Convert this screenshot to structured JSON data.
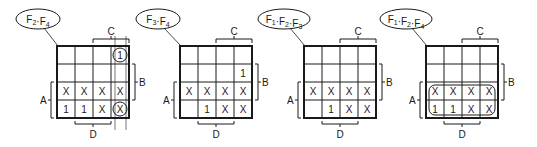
{
  "diagram": {
    "type": "karnaugh-map-set",
    "variables": {
      "row_top": "A",
      "row_right": "B",
      "col_top": "C",
      "col_bottom": "D"
    },
    "maps": [
      {
        "title": "F2·F4",
        "title_parts": [
          {
            "t": "F"
          },
          {
            "s": "2"
          },
          {
            "t": "·F"
          },
          {
            "s": "4"
          }
        ],
        "cells": [
          [
            "",
            "",
            "",
            "1"
          ],
          [
            "",
            "",
            "",
            ""
          ],
          [
            "X",
            "X",
            "X",
            "X"
          ],
          [
            "1",
            "1",
            "X",
            "X"
          ]
        ],
        "loops": [
          "cell-0-3",
          "cell-3-3"
        ]
      },
      {
        "title": "F3·F4",
        "title_parts": [
          {
            "t": "F"
          },
          {
            "s": "3"
          },
          {
            "t": "·F"
          },
          {
            "s": "4"
          }
        ],
        "cells": [
          [
            "",
            "",
            "",
            ""
          ],
          [
            "",
            "",
            "",
            "1"
          ],
          [
            "X",
            "X",
            "X",
            "X"
          ],
          [
            "",
            "1",
            "X",
            "X"
          ]
        ],
        "loops": []
      },
      {
        "title": "F1·F2·F3",
        "title_parts": [
          {
            "t": "F"
          },
          {
            "s": "1"
          },
          {
            "t": "·F"
          },
          {
            "s": "2"
          },
          {
            "t": "·F"
          },
          {
            "s": "3"
          }
        ],
        "cells": [
          [
            "",
            "",
            "",
            ""
          ],
          [
            "",
            "",
            "",
            ""
          ],
          [
            "X",
            "X",
            "X",
            "X"
          ],
          [
            "",
            "1",
            "X",
            "X"
          ]
        ],
        "loops": []
      },
      {
        "title": "F1·F2·F4",
        "title_parts": [
          {
            "t": "F"
          },
          {
            "s": "1"
          },
          {
            "t": "·F"
          },
          {
            "s": "2"
          },
          {
            "t": "·F"
          },
          {
            "s": "4"
          }
        ],
        "cells": [
          [
            "",
            "",
            "",
            ""
          ],
          [
            "",
            "",
            "",
            ""
          ],
          [
            "X",
            "X",
            "X",
            "X"
          ],
          [
            "1",
            "1",
            "X",
            "X"
          ]
        ],
        "loops": [
          "rows-2-3"
        ]
      }
    ]
  }
}
